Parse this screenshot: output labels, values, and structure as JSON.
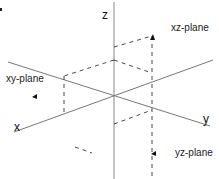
{
  "diagram": {
    "axes": {
      "x": {
        "label": "x"
      },
      "y": {
        "label": "y"
      },
      "z": {
        "label": "z"
      }
    },
    "planes": [
      {
        "id": "xy",
        "label": "xy-plane"
      },
      {
        "id": "xz",
        "label": "xz-plane"
      },
      {
        "id": "yz",
        "label": "yz-plane"
      }
    ],
    "colors": {
      "axis": "#777777",
      "dashed": "#333333",
      "text": "#222222",
      "background": "#ffffff"
    }
  }
}
